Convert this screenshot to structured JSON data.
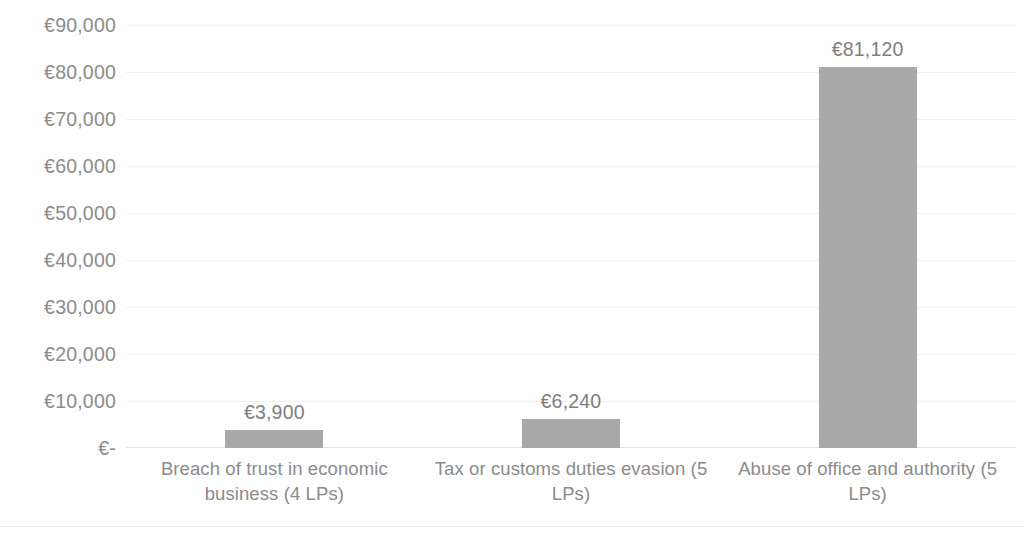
{
  "chart_data": {
    "type": "bar",
    "title": "",
    "subtitle": "",
    "xlabel": "",
    "ylabel": "",
    "categories": [
      "Breach of trust in economic business (4 LPs)",
      "Tax or customs duties evasion (5 LPs)",
      "Abuse of office and authority (5 LPs)"
    ],
    "values": [
      3900,
      6240,
      81120
    ],
    "data_labels": [
      "€3,900",
      "€6,240",
      "€81,120"
    ],
    "ylim": [
      0,
      90000
    ],
    "ytick_values": [
      0,
      10000,
      20000,
      30000,
      40000,
      50000,
      60000,
      70000,
      80000,
      90000
    ],
    "ytick_labels": [
      "€-",
      "€10,000",
      "€20,000",
      "€30,000",
      "€40,000",
      "€50,000",
      "€60,000",
      "€70,000",
      "€80,000",
      "€90,000"
    ],
    "grid": true,
    "grid_axis": "y",
    "legend": false,
    "legend_position": "none",
    "orientation": "vertical",
    "series": [
      {
        "name": "",
        "values": [
          3900,
          6240,
          81120
        ]
      }
    ],
    "colors": {
      "bar_fill": "#a8a8a8",
      "axis_text": "#8c8c8c",
      "data_label_text": "#7e7e7e",
      "gridline": "#f1f1f1",
      "background": "#fefefe"
    }
  }
}
